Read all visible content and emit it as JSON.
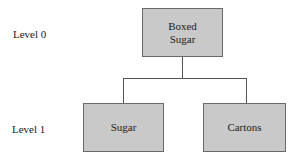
{
  "diagram": {
    "type": "hierarchy-tree",
    "levels": [
      {
        "label": "Level 0"
      },
      {
        "label": "Level 1"
      }
    ],
    "root": {
      "label_line1": "Boxed",
      "label_line2": "Sugar"
    },
    "children": [
      {
        "label": "Sugar"
      },
      {
        "label": "Cartons"
      }
    ],
    "colors": {
      "node_fill": "#c9c9c9",
      "node_border": "#6a6a6a",
      "connector": "#555555",
      "text": "#222222"
    }
  }
}
